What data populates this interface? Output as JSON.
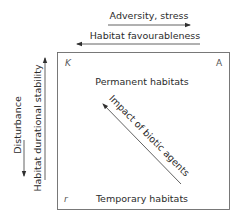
{
  "diagram": {
    "top_arrows": [
      {
        "label": "Adversity, stress",
        "direction": "right"
      },
      {
        "label": "Habitat favourableness",
        "direction": "left"
      }
    ],
    "left_arrows": [
      {
        "label": "Disturbance",
        "direction": "down"
      },
      {
        "label": "Habitat durational stability",
        "direction": "up"
      }
    ],
    "corners": {
      "top_left": "K",
      "top_right": "A",
      "bottom_left": "r"
    },
    "box_labels": {
      "top": "Permanent habitats",
      "bottom": "Temporary habitats"
    },
    "diagonal_arrow": {
      "label": "Impact of biotic agents",
      "direction": "up-left"
    },
    "colors": {
      "line": "#3a3a3a",
      "box": "#6a6a6a",
      "text": "#2b2b2b"
    }
  }
}
